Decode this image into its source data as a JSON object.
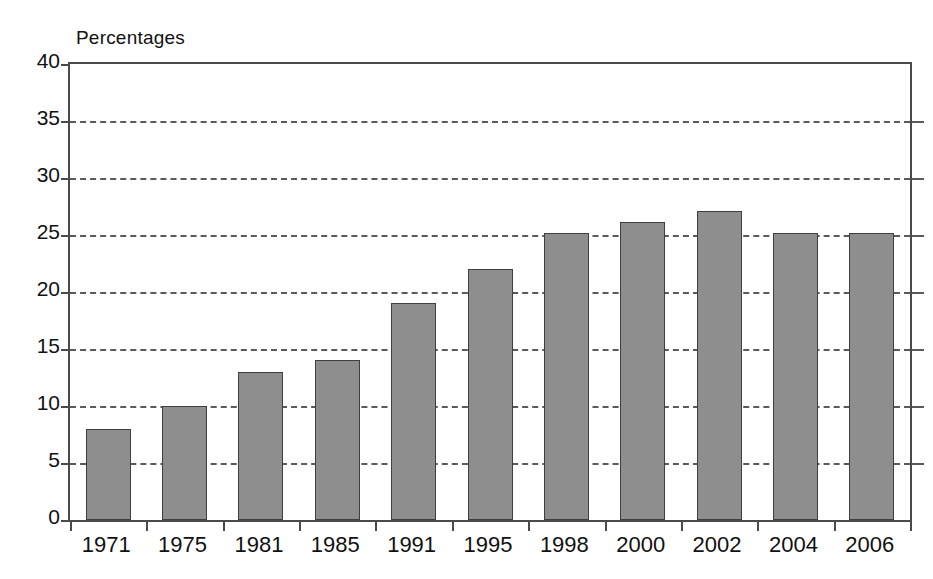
{
  "chart_data": {
    "type": "bar",
    "title": "Percentages",
    "subtitle": "",
    "xlabel": "",
    "ylabel": "Percentages",
    "categories": [
      "1971",
      "1975",
      "1981",
      "1985",
      "1991",
      "1995",
      "1998",
      "2000",
      "2002",
      "2004",
      "2006"
    ],
    "values": [
      8,
      10,
      13,
      14,
      19,
      22,
      25.2,
      26.1,
      27.1,
      25.2,
      25.2
    ],
    "ylim": [
      0,
      40
    ],
    "ytick_values": [
      0,
      5,
      10,
      15,
      20,
      25,
      30,
      35,
      40
    ],
    "ytick_labels": [
      "0",
      "5",
      "10",
      "15",
      "20",
      "25",
      "30",
      "35",
      "40"
    ],
    "grid": "horizontal-dashed",
    "legend": "none",
    "legend_position": "none",
    "bar_fill_color": "#8e8e8e",
    "bar_edge_color": "#3f3f3f",
    "axis_color": "#4a4a4a",
    "grid_color": "#5a5a5a",
    "background_color": "#ffffff",
    "annotations": []
  }
}
